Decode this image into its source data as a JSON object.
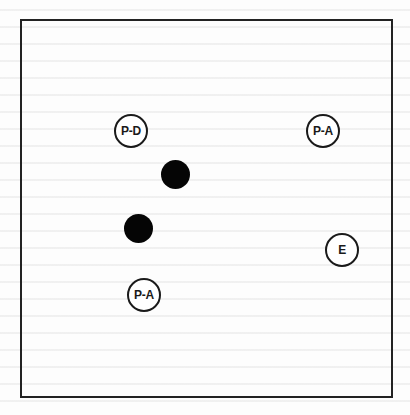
{
  "diagram": {
    "frame": {
      "left": 20,
      "top": 19,
      "right": 392,
      "bottom": 397,
      "border_color": "#222222"
    },
    "labeled_nodes": [
      {
        "id": "pd",
        "label": "P-D",
        "cx": 131,
        "cy": 131
      },
      {
        "id": "pa_top",
        "label": "P-A",
        "cx": 323,
        "cy": 131
      },
      {
        "id": "e",
        "label": "E",
        "cx": 342,
        "cy": 250
      },
      {
        "id": "pa_bottom",
        "label": "P-A",
        "cx": 144,
        "cy": 295
      }
    ],
    "filled_dots": [
      {
        "id": "dot1",
        "cx": 176,
        "cy": 175
      },
      {
        "id": "dot2",
        "cx": 139,
        "cy": 229
      }
    ],
    "colors": {
      "ink": "#1a1a1a",
      "dot_fill": "#050505",
      "background": "#fdfdfd"
    }
  }
}
